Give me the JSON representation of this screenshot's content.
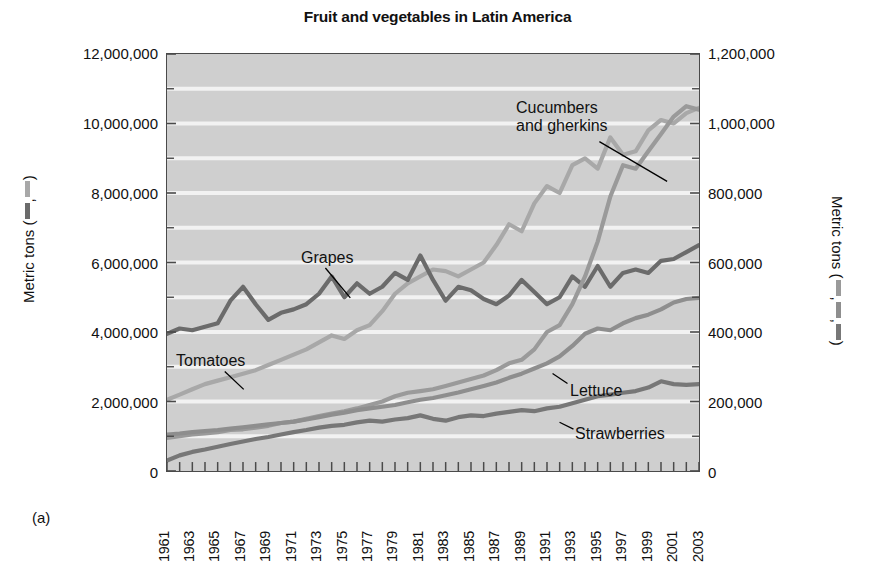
{
  "figure": {
    "title": "Fruit and vegetables in Latin America",
    "panel_label": "(a)"
  },
  "axes": {
    "left_title_prefix": "Metric tons (",
    "left_title_sep": ",",
    "left_title_suffix": ")",
    "right_title_prefix": "Metric tons (",
    "right_title_sep1": ",",
    "right_title_sep2": ",",
    "right_title_suffix": ")",
    "left_ticks": [
      "0",
      "2,000,000",
      "4,000,000",
      "6,000,000",
      "8,000,000",
      "10,000,000",
      "12,000,000"
    ],
    "right_ticks": [
      "0",
      "200,000",
      "400,000",
      "600,000",
      "800,000",
      "1,000,000",
      "1,200,000"
    ],
    "x_ticks": [
      "1961",
      "1963",
      "1965",
      "1967",
      "1969",
      "1971",
      "1973",
      "1975",
      "1977",
      "1979",
      "1981",
      "1983",
      "1985",
      "1987",
      "1989",
      "1991",
      "1993",
      "1995",
      "1997",
      "1999",
      "2001",
      "2003"
    ]
  },
  "colors": {
    "plot_background": "#cfcfcf",
    "gridline": "#f2f2f2",
    "frame": "#4a4a4a",
    "grapes": "#6b6b6b",
    "tomatoes": "#a8a8a8",
    "cucumbers": "#9a9a9a",
    "lettuce": "#8e8e8e",
    "strawberries": "#777777",
    "leader_line": "#000000"
  },
  "series_labels": [
    {
      "name": "tomatoes",
      "text": "Tomatoes",
      "x": 176,
      "y": 352
    },
    {
      "name": "grapes",
      "text": "Grapes",
      "x": 301,
      "y": 249
    },
    {
      "name": "cucumbers-and-gherkins",
      "text_line1": "Cucumbers",
      "text_line2": "and gherkins",
      "x": 516,
      "y": 99
    },
    {
      "name": "lettuce",
      "text": "Lettuce",
      "x": 570,
      "y": 382
    },
    {
      "name": "strawberries",
      "text": "Strawberries",
      "x": 575,
      "y": 425
    }
  ],
  "chart_data": {
    "type": "line",
    "title": "Fruit and vegetables in Latin America",
    "xlabel": "",
    "ylabel": "Metric tons",
    "ylabel_right": "Metric tons",
    "xlim": [
      1961,
      2003
    ],
    "ylim_left": [
      0,
      12000000
    ],
    "ylim_right": [
      0,
      1200000
    ],
    "grid": true,
    "legend": "inline-annotations",
    "x": [
      1961,
      1962,
      1963,
      1964,
      1965,
      1966,
      1967,
      1968,
      1969,
      1970,
      1971,
      1972,
      1973,
      1974,
      1975,
      1976,
      1977,
      1978,
      1979,
      1980,
      1981,
      1982,
      1983,
      1984,
      1985,
      1986,
      1987,
      1988,
      1989,
      1990,
      1991,
      1992,
      1993,
      1994,
      1995,
      1996,
      1997,
      1998,
      1999,
      2000,
      2001,
      2002,
      2003
    ],
    "series": [
      {
        "name": "Tomatoes",
        "axis": "left",
        "color": "#a8a8a8",
        "units": "metric tons",
        "values": [
          2050000,
          2200000,
          2350000,
          2500000,
          2600000,
          2700000,
          2800000,
          2900000,
          3050000,
          3200000,
          3350000,
          3500000,
          3700000,
          3900000,
          3800000,
          4050000,
          4200000,
          4600000,
          5100000,
          5400000,
          5600000,
          5800000,
          5750000,
          5600000,
          5800000,
          6000000,
          6500000,
          7100000,
          6900000,
          7700000,
          8200000,
          8000000,
          8800000,
          9000000,
          8700000,
          9600000,
          9100000,
          9200000,
          9800000,
          10100000,
          10000000,
          10300000,
          10450000
        ]
      },
      {
        "name": "Grapes",
        "axis": "left",
        "color": "#6b6b6b",
        "units": "metric tons",
        "values": [
          3950000,
          4100000,
          4050000,
          4150000,
          4250000,
          4900000,
          5300000,
          4800000,
          4350000,
          4550000,
          4650000,
          4800000,
          5100000,
          5600000,
          5000000,
          5400000,
          5100000,
          5300000,
          5700000,
          5500000,
          6200000,
          5500000,
          4900000,
          5300000,
          5200000,
          4950000,
          4800000,
          5050000,
          5500000,
          5150000,
          4800000,
          5000000,
          5600000,
          5300000,
          5900000,
          5300000,
          5700000,
          5800000,
          5700000,
          6050000,
          6100000,
          6300000,
          6500000
        ]
      },
      {
        "name": "Cucumbers and gherkins",
        "axis": "right",
        "color": "#9a9a9a",
        "units": "metric tons",
        "values": [
          95000,
          100000,
          105000,
          108000,
          112000,
          118000,
          120000,
          125000,
          130000,
          138000,
          142000,
          150000,
          158000,
          165000,
          172000,
          180000,
          190000,
          200000,
          215000,
          225000,
          230000,
          235000,
          245000,
          255000,
          265000,
          275000,
          290000,
          310000,
          320000,
          350000,
          400000,
          420000,
          480000,
          560000,
          660000,
          790000,
          880000,
          870000,
          920000,
          970000,
          1020000,
          1050000,
          1040000
        ]
      },
      {
        "name": "Lettuce",
        "axis": "right",
        "color": "#8e8e8e",
        "units": "metric tons",
        "values": [
          105000,
          108000,
          112000,
          115000,
          118000,
          122000,
          126000,
          130000,
          134000,
          138000,
          142000,
          148000,
          155000,
          162000,
          168000,
          175000,
          180000,
          185000,
          190000,
          198000,
          205000,
          210000,
          218000,
          226000,
          235000,
          245000,
          255000,
          268000,
          280000,
          295000,
          310000,
          330000,
          360000,
          395000,
          410000,
          405000,
          425000,
          440000,
          450000,
          465000,
          485000,
          495000,
          498000
        ]
      },
      {
        "name": "Strawberries",
        "axis": "right",
        "color": "#777777",
        "units": "metric tons",
        "values": [
          30000,
          45000,
          55000,
          62000,
          70000,
          78000,
          85000,
          92000,
          98000,
          105000,
          112000,
          118000,
          125000,
          130000,
          133000,
          140000,
          145000,
          142000,
          148000,
          152000,
          160000,
          150000,
          145000,
          155000,
          160000,
          158000,
          165000,
          170000,
          175000,
          172000,
          180000,
          185000,
          195000,
          205000,
          215000,
          220000,
          225000,
          230000,
          240000,
          258000,
          250000,
          248000,
          250000
        ]
      }
    ]
  }
}
